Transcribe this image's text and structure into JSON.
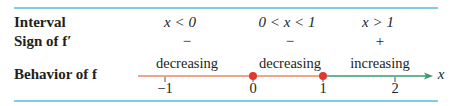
{
  "table": {
    "rows": {
      "interval": {
        "label": "Interval",
        "cells": [
          "x < 0",
          "0 < x < 1",
          "x > 1"
        ]
      },
      "sign": {
        "label": "Sign of f′",
        "cells": [
          "−",
          "−",
          "+"
        ]
      },
      "behavior": {
        "label": "Behavior of f",
        "cells": [
          "decreasing",
          "decreasing",
          "increasing"
        ]
      }
    }
  },
  "number_line": {
    "axis_label": "x",
    "ticks": [
      {
        "value": -1,
        "label": "−1"
      },
      {
        "value": 0,
        "label": "0"
      },
      {
        "value": 1,
        "label": "1"
      },
      {
        "value": 2,
        "label": "2"
      }
    ],
    "critical_points": [
      0,
      1
    ],
    "colors": {
      "decreasing": "#e8896a",
      "increasing": "#3d9a6e",
      "point": "#e03a2f",
      "rule": "#7fcde0"
    }
  }
}
